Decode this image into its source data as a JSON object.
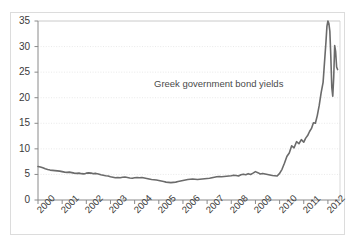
{
  "chart_data": {
    "type": "line",
    "title": "",
    "annotation": "Greek government bond yields",
    "xlabel": "",
    "ylabel": "",
    "ylim": [
      0,
      35
    ],
    "xlim": [
      2000,
      2012.5
    ],
    "yticks": [
      0,
      5,
      10,
      15,
      20,
      25,
      30,
      35
    ],
    "xticks": [
      "2000",
      "2001",
      "2002",
      "2003",
      "2004",
      "2005",
      "2006",
      "2007",
      "2008",
      "2009",
      "2010",
      "2011",
      "2012"
    ],
    "grid": "horizontal-dotted",
    "legend": "none",
    "series_color": "#6b6b6b",
    "axis_color": "#8a8a8a",
    "grid_color": "#e3e3e3",
    "series": [
      {
        "name": "Greek government bond yields",
        "x": [
          2000.0,
          2000.1,
          2000.2,
          2000.3,
          2000.4,
          2000.5,
          2000.6,
          2000.7,
          2000.8,
          2000.9,
          2001.0,
          2001.1,
          2001.2,
          2001.3,
          2001.4,
          2001.5,
          2001.6,
          2001.7,
          2001.8,
          2001.9,
          2002.0,
          2002.1,
          2002.2,
          2002.3,
          2002.4,
          2002.5,
          2002.6,
          2002.7,
          2002.8,
          2002.9,
          2003.0,
          2003.1,
          2003.2,
          2003.3,
          2003.4,
          2003.5,
          2003.6,
          2003.7,
          2003.8,
          2003.9,
          2004.0,
          2004.1,
          2004.2,
          2004.3,
          2004.4,
          2004.5,
          2004.6,
          2004.7,
          2004.8,
          2004.9,
          2005.0,
          2005.1,
          2005.2,
          2005.3,
          2005.4,
          2005.5,
          2005.6,
          2005.7,
          2005.8,
          2005.9,
          2006.0,
          2006.1,
          2006.2,
          2006.3,
          2006.4,
          2006.5,
          2006.6,
          2006.7,
          2006.8,
          2006.9,
          2007.0,
          2007.1,
          2007.2,
          2007.3,
          2007.4,
          2007.5,
          2007.6,
          2007.7,
          2007.8,
          2007.9,
          2008.0,
          2008.1,
          2008.2,
          2008.3,
          2008.4,
          2008.5,
          2008.6,
          2008.7,
          2008.8,
          2008.9,
          2009.0,
          2009.1,
          2009.2,
          2009.3,
          2009.4,
          2009.5,
          2009.6,
          2009.7,
          2009.8,
          2009.9,
          2010.0,
          2010.1,
          2010.2,
          2010.3,
          2010.4,
          2010.5,
          2010.6,
          2010.7,
          2010.8,
          2010.9,
          2011.0,
          2011.08,
          2011.16,
          2011.24,
          2011.32,
          2011.4,
          2011.48,
          2011.56,
          2011.64,
          2011.72,
          2011.8,
          2011.86,
          2011.92,
          2011.96,
          2012.0,
          2012.04,
          2012.08,
          2012.12,
          2012.16,
          2012.2,
          2012.24,
          2012.28,
          2012.32,
          2012.36,
          2012.4
        ],
        "y": [
          6.55,
          6.45,
          6.3,
          6.1,
          5.95,
          5.85,
          5.8,
          5.75,
          5.7,
          5.65,
          5.55,
          5.45,
          5.4,
          5.45,
          5.35,
          5.25,
          5.2,
          5.25,
          5.15,
          5.1,
          5.25,
          5.3,
          5.25,
          5.15,
          5.2,
          5.1,
          4.95,
          4.85,
          4.75,
          4.7,
          4.55,
          4.45,
          4.35,
          4.4,
          4.35,
          4.45,
          4.5,
          4.4,
          4.3,
          4.25,
          4.35,
          4.4,
          4.35,
          4.4,
          4.3,
          4.2,
          4.1,
          4.0,
          3.95,
          3.9,
          3.8,
          3.7,
          3.6,
          3.5,
          3.45,
          3.4,
          3.45,
          3.5,
          3.6,
          3.7,
          3.8,
          3.9,
          4.0,
          4.05,
          4.1,
          4.05,
          4.0,
          4.05,
          4.1,
          4.15,
          4.2,
          4.25,
          4.35,
          4.45,
          4.55,
          4.6,
          4.55,
          4.6,
          4.65,
          4.7,
          4.75,
          4.85,
          4.8,
          4.7,
          4.95,
          5.05,
          4.95,
          5.15,
          5.0,
          5.25,
          5.55,
          5.35,
          5.1,
          5.2,
          5.1,
          5.0,
          4.9,
          4.8,
          4.75,
          4.7,
          5.2,
          6.0,
          7.2,
          8.5,
          9.2,
          10.6,
          10.2,
          11.4,
          11.0,
          11.8,
          11.3,
          12.1,
          12.6,
          13.4,
          14.0,
          15.1,
          15.0,
          16.5,
          18.5,
          21.0,
          23.0,
          27.0,
          31.0,
          34.0,
          35.0,
          34.5,
          33.0,
          28.0,
          22.0,
          20.3,
          24.0,
          30.2,
          29.0,
          26.0,
          25.5
        ]
      }
    ]
  }
}
